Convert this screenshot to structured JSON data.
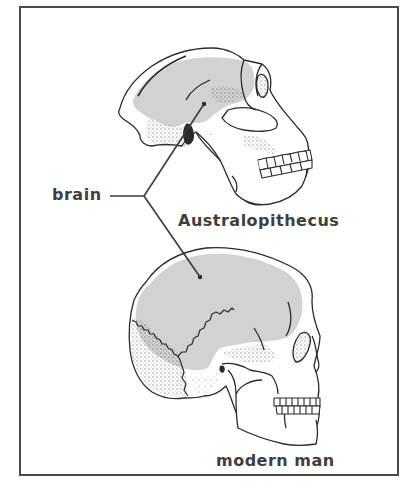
{
  "diagram": {
    "labels": {
      "brain": "brain",
      "australopithecus": "Australopithecus",
      "modern_man": "modern man"
    },
    "colors": {
      "frame": "#4a4a4a",
      "outline": "#2a2a2a",
      "brain_fill": "#d2d2d2",
      "bone_fill": "#ffffff",
      "text": "#3e3e3e"
    }
  }
}
